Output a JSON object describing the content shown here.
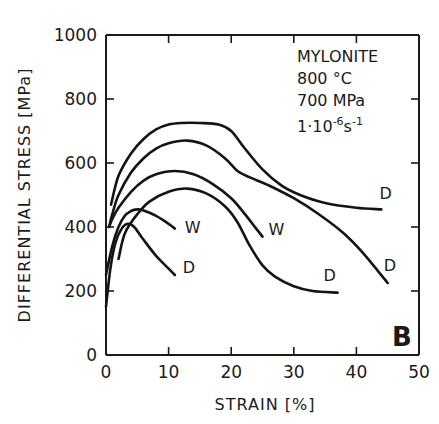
{
  "chart_data": {
    "type": "line",
    "title": "",
    "panel_label": "B",
    "xlabel": "STRAIN [%]",
    "ylabel": "DIFFERENTIAL STRESS [MPa]",
    "xlim": [
      0,
      50
    ],
    "ylim": [
      0,
      1000
    ],
    "xticks": [
      0,
      10,
      20,
      30,
      40,
      50
    ],
    "yticks": [
      0,
      200,
      400,
      600,
      800,
      1000
    ],
    "grid": false,
    "annotation": {
      "lines": [
        "MYLONITE",
        "800 °C",
        "700 MPa",
        "1·10⁻⁶s⁻¹"
      ]
    },
    "series": [
      {
        "name": "curve-1",
        "end_label": "D",
        "x": [
          0.8,
          2,
          4,
          6,
          8,
          10,
          12,
          15,
          18,
          20,
          22,
          25,
          28,
          31,
          35,
          40,
          44
        ],
        "y": [
          470,
          560,
          630,
          675,
          705,
          720,
          725,
          725,
          720,
          700,
          650,
          580,
          530,
          500,
          475,
          460,
          455
        ]
      },
      {
        "name": "curve-2",
        "end_label": "D",
        "x": [
          0.5,
          1,
          2,
          4,
          6,
          8,
          10,
          13,
          16,
          19,
          21,
          23,
          26,
          30,
          34,
          38,
          41,
          45
        ],
        "y": [
          400,
          440,
          500,
          570,
          615,
          645,
          662,
          670,
          655,
          615,
          575,
          555,
          530,
          490,
          440,
          380,
          320,
          225
        ]
      },
      {
        "name": "curve-3",
        "end_label": "W",
        "x": [
          0.5,
          1,
          2,
          4,
          6,
          8,
          11,
          14,
          17,
          20,
          22,
          24,
          25
        ],
        "y": [
          400,
          425,
          460,
          510,
          545,
          565,
          575,
          565,
          535,
          490,
          445,
          395,
          370
        ]
      },
      {
        "name": "curve-4",
        "end_label": "D",
        "x": [
          2,
          3,
          5,
          7,
          10,
          13,
          16,
          19,
          21,
          23,
          25,
          27,
          30,
          33,
          37
        ],
        "y": [
          300,
          380,
          440,
          480,
          510,
          520,
          505,
          465,
          415,
          340,
          280,
          245,
          215,
          200,
          195
        ]
      },
      {
        "name": "curve-5",
        "end_label": "W",
        "x": [
          0,
          1,
          2,
          3,
          4,
          5,
          6,
          8,
          10,
          11
        ],
        "y": [
          250,
          340,
          400,
          435,
          450,
          455,
          452,
          435,
          410,
          395
        ]
      },
      {
        "name": "curve-6",
        "end_label": "D",
        "x": [
          0,
          0.7,
          1.5,
          2.5,
          3.5,
          4.5,
          6,
          8,
          10,
          11
        ],
        "y": [
          150,
          270,
          350,
          395,
          410,
          400,
          360,
          310,
          270,
          250
        ]
      }
    ]
  },
  "labels": {
    "x_axis_title": "STRAIN [%]",
    "y_axis_title": "DIFFERENTIAL  STRESS [MPa]",
    "panel": "B",
    "annotation": [
      "MYLONITE",
      "800 °C",
      "700 MPa"
    ],
    "rate_base": "1·10",
    "rate_exp": "-6",
    "rate_unit": "s",
    "rate_unit_exp": "-1"
  }
}
